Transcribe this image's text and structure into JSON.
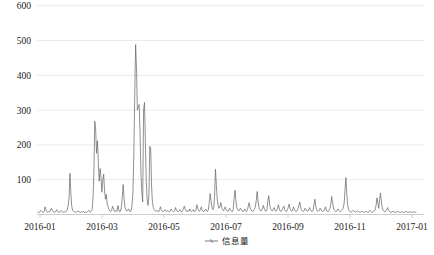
{
  "chart_data": {
    "type": "line",
    "title": "",
    "xlabel": "",
    "ylabel": "",
    "ylim": [
      0,
      640
    ],
    "xlim": [
      "2016-01-01",
      "2017-01-10"
    ],
    "grid": true,
    "legend_position": "bottom-center",
    "y_ticks": [
      100,
      200,
      300,
      400,
      500,
      600
    ],
    "y_tick_labels": [
      "100",
      "200",
      "300",
      "400",
      "500",
      "600"
    ],
    "x_ticks": [
      "2016-01",
      "2016-03",
      "2016-05",
      "2016-07",
      "2016-09",
      "2016-11",
      "2017-01"
    ],
    "x_tick_labels": [
      "2016-01",
      "2016-03",
      "2016-05",
      "2016-07",
      "2016-09",
      "2016-11",
      "2017-01"
    ],
    "series": [
      {
        "name": "信息量",
        "color": "#6b6b6b",
        "values": [
          6,
          5,
          8,
          12,
          9,
          7,
          6,
          10,
          22,
          14,
          8,
          6,
          9,
          7,
          11,
          18,
          12,
          8,
          7,
          6,
          9,
          14,
          10,
          7,
          6,
          8,
          12,
          9,
          7,
          6,
          8,
          7,
          9,
          14,
          26,
          48,
          118,
          62,
          24,
          12,
          9,
          8,
          7,
          6,
          8,
          10,
          9,
          7,
          6,
          8,
          7,
          9,
          6,
          8,
          7,
          6,
          9,
          12,
          8,
          7,
          9,
          14,
          48,
          120,
          268,
          244,
          176,
          212,
          150,
          96,
          132,
          108,
          64,
          98,
          116,
          70,
          44,
          58,
          30,
          22,
          14,
          10,
          8,
          12,
          24,
          16,
          10,
          8,
          12,
          9,
          26,
          14,
          8,
          10,
          22,
          52,
          86,
          46,
          20,
          14,
          10,
          12,
          16,
          10,
          8,
          12,
          28,
          64,
          176,
          342,
          488,
          420,
          300,
          310,
          316,
          236,
          120,
          64,
          36,
          300,
          322,
          210,
          96,
          44,
          26,
          54,
          196,
          188,
          80,
          34,
          20,
          14,
          11,
          9,
          12,
          10,
          8,
          14,
          22,
          12,
          9,
          8,
          11,
          14,
          10,
          8,
          12,
          9,
          7,
          10,
          16,
          12,
          9,
          8,
          11,
          20,
          13,
          9,
          8,
          10,
          14,
          9,
          8,
          12,
          18,
          24,
          14,
          10,
          8,
          12,
          9,
          16,
          11,
          8,
          10,
          14,
          9,
          8,
          12,
          28,
          18,
          11,
          9,
          14,
          22,
          13,
          9,
          8,
          12,
          16,
          10,
          9,
          14,
          34,
          60,
          40,
          22,
          14,
          18,
          52,
          130,
          86,
          44,
          26,
          18,
          22,
          34,
          20,
          14,
          11,
          16,
          22,
          14,
          10,
          9,
          13,
          18,
          12,
          9,
          8,
          14,
          46,
          70,
          40,
          20,
          14,
          10,
          12,
          18,
          14,
          10,
          8,
          12,
          16,
          10,
          9,
          14,
          24,
          34,
          20,
          13,
          10,
          8,
          12,
          16,
          22,
          40,
          66,
          38,
          20,
          14,
          10,
          12,
          18,
          26,
          16,
          11,
          9,
          14,
          38,
          54,
          30,
          18,
          12,
          10,
          14,
          20,
          13,
          9,
          12,
          18,
          28,
          16,
          10,
          9,
          13,
          18,
          24,
          14,
          10,
          8,
          12,
          20,
          30,
          18,
          12,
          9,
          14,
          22,
          13,
          10,
          8,
          12,
          18,
          26,
          36,
          20,
          13,
          10,
          8,
          12,
          18,
          14,
          10,
          9,
          13,
          20,
          14,
          10,
          8,
          12,
          28,
          44,
          24,
          14,
          10,
          9,
          12,
          18,
          13,
          10,
          8,
          11,
          16,
          22,
          13,
          9,
          8,
          12,
          18,
          30,
          52,
          34,
          18,
          12,
          9,
          8,
          12,
          16,
          11,
          9,
          8,
          11,
          14,
          20,
          32,
          70,
          106,
          58,
          26,
          14,
          10,
          8,
          7,
          9,
          12,
          10,
          8,
          7,
          9,
          11,
          8,
          7,
          6,
          8,
          10,
          8,
          7,
          6,
          8,
          9,
          7,
          6,
          8,
          12,
          9,
          7,
          6,
          8,
          10,
          14,
          26,
          48,
          34,
          18,
          44,
          62,
          36,
          20,
          12,
          9,
          8,
          10,
          14,
          20,
          12,
          9,
          7,
          6,
          8,
          10,
          8,
          7,
          6,
          7,
          9,
          8,
          7,
          6,
          7,
          8,
          7,
          6,
          7,
          8,
          9,
          7,
          6,
          7,
          8,
          7,
          6,
          7,
          8,
          7,
          6,
          7
        ]
      }
    ],
    "annotations": []
  },
  "legend": {
    "items": [
      {
        "label": "信息量",
        "marker": "line-with-dash",
        "color": "#6b6b6b"
      }
    ]
  },
  "axes": {
    "y_axis_name": "y-axis",
    "x_axis_name": "x-axis"
  }
}
